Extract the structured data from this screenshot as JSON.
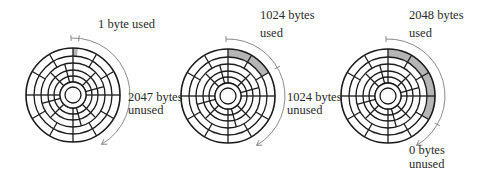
{
  "diagram": {
    "type": "disk-block-usage",
    "colors": {
      "line": "#1a1a1a",
      "used_fill": "#b5b5b5",
      "arrow": "#8a8a8a",
      "text": "#2a2a2a",
      "background": "#ffffff"
    },
    "sectors_per_track": 12,
    "tracks": 4,
    "disks": [
      {
        "id": "disk-1",
        "used_fraction_deg": 6,
        "used_label": [
          "1 byte used"
        ],
        "unused_label": [
          "2047 bytes",
          "unused"
        ]
      },
      {
        "id": "disk-2",
        "used_fraction_deg": 60,
        "used_label": [
          "1024 bytes",
          "used"
        ],
        "unused_label": [
          "1024 bytes",
          "unused"
        ]
      },
      {
        "id": "disk-3",
        "used_fraction_deg": 120,
        "used_label": [
          "2048 bytes",
          "used"
        ],
        "unused_label": [
          "0 bytes",
          "unused"
        ]
      }
    ]
  }
}
